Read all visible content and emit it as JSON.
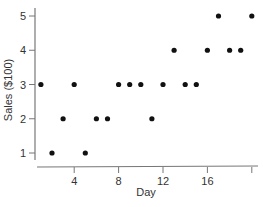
{
  "chart_data": {
    "type": "scatter",
    "title": "",
    "xlabel": "Day",
    "ylabel": "Sales ($100)",
    "xlim": [
      0.5,
      20.5
    ],
    "ylim": [
      0.6,
      5.3
    ],
    "xticks": [
      4,
      8,
      12,
      16,
      20
    ],
    "xtick_labels": [
      "4",
      "8",
      "12",
      "16",
      ""
    ],
    "yticks": [
      1,
      2,
      3,
      4,
      5
    ],
    "ytick_labels": [
      "1",
      "2",
      "3",
      "4",
      "5"
    ],
    "grid": false,
    "legend": null,
    "series": [
      {
        "name": "Sales",
        "x": [
          1,
          2,
          3,
          4,
          5,
          6,
          7,
          8,
          9,
          10,
          11,
          12,
          13,
          14,
          15,
          16,
          17,
          18,
          19,
          20
        ],
        "y": [
          3,
          1,
          2,
          3,
          1,
          2,
          2,
          3,
          3,
          3,
          2,
          3,
          4,
          3,
          3,
          4,
          5,
          4,
          4,
          5
        ]
      }
    ],
    "marker_color": "#111111",
    "axis_color": "#777777"
  }
}
